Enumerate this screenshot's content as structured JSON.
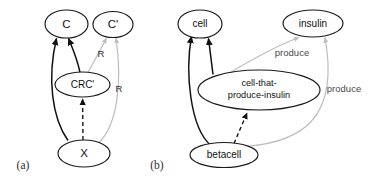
{
  "figure": {
    "type": "diagram",
    "width": 375,
    "height": 185,
    "background_color": "#ffffff",
    "colors": {
      "node_stroke": "#1a1a1a",
      "node_fill": "#ffffff",
      "edge_dark": "#111111",
      "edge_light": "#bdbdbd",
      "text": "#111111"
    }
  },
  "panels": [
    {
      "id": "a",
      "label": "(a)",
      "label_pos": {
        "x": 23,
        "y": 166
      },
      "nodes": [
        {
          "id": "c",
          "label": "C",
          "cx": 66.5,
          "cy": 24,
          "rx": 21.5,
          "ry": 14,
          "size": "lg"
        },
        {
          "id": "cp",
          "label": "C'",
          "cx": 113,
          "cy": 24.5,
          "rx": 20,
          "ry": 13,
          "size": "lg"
        },
        {
          "id": "crcp",
          "label": "CRC'",
          "cx": 82.5,
          "cy": 84.5,
          "rx": 27.5,
          "ry": 12.5,
          "size": "md"
        },
        {
          "id": "x",
          "label": "X",
          "cx": 84,
          "cy": 153.5,
          "rx": 26,
          "ry": 13.5,
          "size": "lg"
        }
      ],
      "edges": [
        {
          "id": "a-x-to-c",
          "from": "x",
          "to": "c",
          "style": "solid-dark",
          "label": ""
        },
        {
          "id": "a-crcp-to-c",
          "from": "crcp",
          "to": "c",
          "style": "solid-dark",
          "label": ""
        },
        {
          "id": "a-crcp-to-cp",
          "from": "crcp",
          "to": "cp",
          "style": "solid-light",
          "label": "R"
        },
        {
          "id": "a-x-to-cp",
          "from": "x",
          "to": "cp",
          "style": "solid-light",
          "label": "R"
        },
        {
          "id": "a-x-to-crcp",
          "from": "x",
          "to": "crcp",
          "style": "dashed-dark",
          "label": ""
        }
      ],
      "edge_labels": [
        {
          "id": "a-label-r1",
          "text": "R",
          "x": 101,
          "y": 54
        },
        {
          "id": "a-label-r2",
          "text": "R",
          "x": 119,
          "y": 89
        }
      ]
    },
    {
      "id": "b",
      "label": "(b)",
      "label_pos": {
        "x": 157,
        "y": 166
      },
      "nodes": [
        {
          "id": "cell",
          "label": "cell",
          "cx": 200,
          "cy": 24,
          "rx": 22,
          "ry": 14,
          "size": "md"
        },
        {
          "id": "insulin",
          "label": "insulin",
          "cx": 313,
          "cy": 23.5,
          "rx": 30,
          "ry": 13.5,
          "size": "md"
        },
        {
          "id": "ctpi",
          "label": "cell-that-|produce-insulin",
          "cx": 259,
          "cy": 90,
          "rx": 61,
          "ry": 20,
          "size": "sm"
        },
        {
          "id": "betacell",
          "label": "betacell",
          "cx": 224,
          "cy": 155,
          "rx": 34,
          "ry": 12.5,
          "size": "md"
        }
      ],
      "edges": [
        {
          "id": "b-ctpi-to-cell",
          "from": "ctpi",
          "to": "cell",
          "style": "solid-dark",
          "label": ""
        },
        {
          "id": "b-betacell-to-cell",
          "from": "betacell",
          "to": "cell",
          "style": "solid-dark",
          "label": ""
        },
        {
          "id": "b-ctpi-to-insulin",
          "from": "ctpi",
          "to": "insulin",
          "style": "solid-light",
          "label": "produce"
        },
        {
          "id": "b-betacell-to-insulin",
          "from": "betacell",
          "to": "insulin",
          "style": "solid-light",
          "label": "produce"
        },
        {
          "id": "b-betacell-to-ctpi",
          "from": "betacell",
          "to": "ctpi",
          "style": "dashed-dark",
          "label": ""
        }
      ],
      "edge_labels": [
        {
          "id": "b-label-produce1",
          "text": "produce",
          "x": 292,
          "y": 53
        },
        {
          "id": "b-label-produce2",
          "text": "produce",
          "x": 344,
          "y": 89
        }
      ]
    }
  ],
  "node_texts": {
    "a_c": "C",
    "a_cp": "C'",
    "a_crcp": "CRC'",
    "a_x": "X",
    "b_cell": "cell",
    "b_insulin": "insulin",
    "b_ctpi_line1": "cell-that-",
    "b_ctpi_line2": "produce-insulin",
    "b_betacell": "betacell"
  },
  "edge_texts": {
    "a_r1": "R",
    "a_r2": "R",
    "b_produce1": "produce",
    "b_produce2": "produce"
  },
  "panel_texts": {
    "a": "(a)",
    "b": "(b)"
  }
}
